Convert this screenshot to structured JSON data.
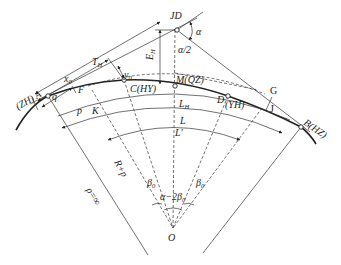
{
  "diagram": {
    "type": "highway transition curve geometry",
    "points": {
      "jd": "JD",
      "zh": "(ZH) A",
      "hz": "B(HZ)",
      "hy": "C(HY)",
      "qz": "M(QZ)",
      "yh_d": "D",
      "yh": "(YH)",
      "g": "G",
      "j": "J",
      "o": "O",
      "k": "K"
    },
    "labels": {
      "alpha": "α",
      "alpha_half": "α/2",
      "e_h": "E",
      "e_h_sub": "H",
      "t_h": "T",
      "t_h_sub": "H",
      "x0": "x",
      "x0_sub": "0",
      "y0": "y",
      "y0_sub": "0",
      "q": "q",
      "f": "F",
      "p": "p",
      "l_h": "L",
      "l_h_sub": "H",
      "l": "L",
      "l_prime": "L′",
      "r_plus_p": "R+p",
      "beta0_left": "β",
      "beta0_left_sub": "0",
      "beta0_right": "β",
      "beta0_right_sub": "0",
      "alpha_minus_2beta0": "α−2β",
      "alpha_minus_2beta0_sub": "0",
      "rho_inf": "ρ=∞"
    },
    "colors": {
      "line": "#222222",
      "background": "#ffffff"
    }
  }
}
